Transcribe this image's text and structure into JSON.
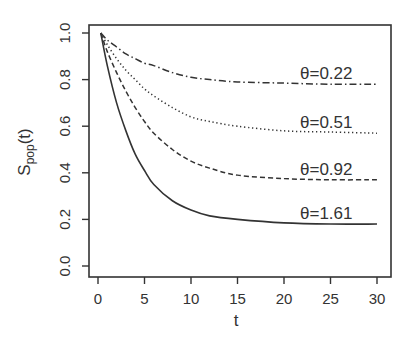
{
  "chart_data": {
    "type": "line",
    "title": "",
    "xlabel": "t",
    "ylabel_main": "S",
    "ylabel_sub": "pop",
    "ylabel_suffix": "(t)",
    "xlim": [
      0,
      30
    ],
    "ylim": [
      0.0,
      1.0
    ],
    "x_ticks": [
      0,
      5,
      10,
      15,
      20,
      25,
      30
    ],
    "x_tick_labels": [
      "0",
      "5",
      "10",
      "15",
      "20",
      "25",
      "30"
    ],
    "y_ticks": [
      0.0,
      0.2,
      0.4,
      0.6,
      0.8,
      1.0
    ],
    "y_tick_labels": [
      "0.0",
      "0.2",
      "0.4",
      "0.6",
      "0.8",
      "1.0"
    ],
    "grid": false,
    "legend": "inline labels near right end of curves",
    "x": [
      0.3,
      1,
      2,
      3,
      4,
      5,
      6,
      8,
      10,
      12,
      15,
      20,
      25,
      30
    ],
    "series": [
      {
        "name": "θ=0.22",
        "label": "θ=0.22",
        "linestyle": "dashdot",
        "values": [
          1.0,
          0.97,
          0.94,
          0.91,
          0.89,
          0.87,
          0.86,
          0.83,
          0.81,
          0.8,
          0.79,
          0.785,
          0.78,
          0.78
        ]
      },
      {
        "name": "θ=0.51",
        "label": "θ=0.51",
        "linestyle": "dotted",
        "values": [
          1.0,
          0.95,
          0.89,
          0.84,
          0.8,
          0.76,
          0.73,
          0.68,
          0.64,
          0.62,
          0.6,
          0.58,
          0.575,
          0.57
        ]
      },
      {
        "name": "θ=0.92",
        "label": "θ=0.92",
        "linestyle": "dashed",
        "values": [
          1.0,
          0.92,
          0.83,
          0.75,
          0.68,
          0.62,
          0.57,
          0.5,
          0.45,
          0.42,
          0.39,
          0.375,
          0.37,
          0.37
        ]
      },
      {
        "name": "θ=1.61",
        "label": "θ=1.61",
        "linestyle": "solid",
        "values": [
          1.0,
          0.86,
          0.7,
          0.58,
          0.48,
          0.41,
          0.35,
          0.28,
          0.24,
          0.215,
          0.2,
          0.185,
          0.18,
          0.18
        ]
      }
    ]
  },
  "colors": {
    "line": "#333333",
    "axis": "#333333",
    "background": "#ffffff"
  }
}
